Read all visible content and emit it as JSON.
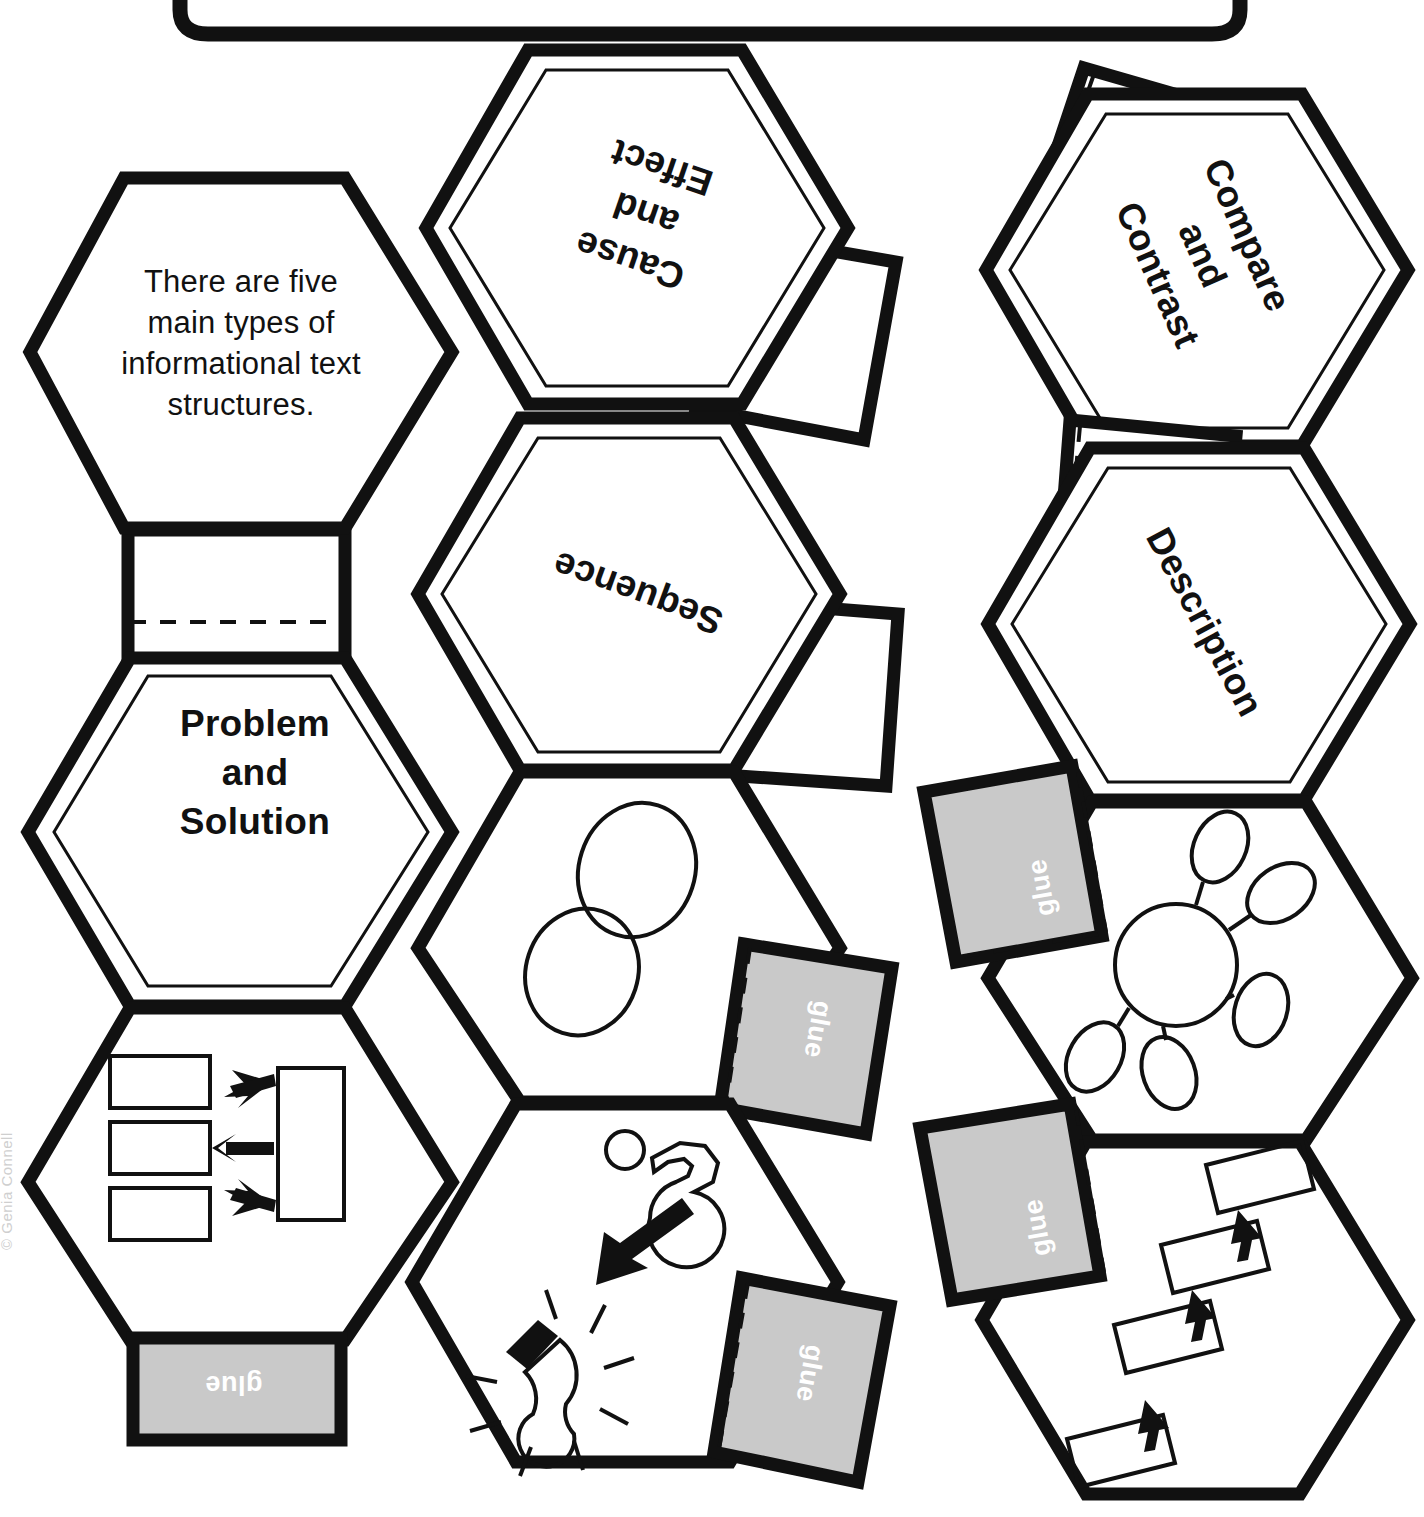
{
  "page": {
    "width": 1424,
    "height": 1517,
    "background": "#ffffff",
    "ink": "#111111",
    "glue_fill": "#c9c9c9",
    "glue_text_color": "#ffffff"
  },
  "top_bar": {
    "shape": "rounded-rectangle-bottom-edge"
  },
  "watermark": {
    "text": "© Genia Connell"
  },
  "intro": {
    "text": "There are five\nmain types of\ninformational text\nstructures."
  },
  "labels": {
    "cause_effect": "Cause\nand\nEffect",
    "compare_contrast": "Compare\nand\nContrast",
    "sequence": "Sequence",
    "description": "Description",
    "problem_solution": "Problem\nand\nSolution"
  },
  "glue_tabs": [
    {
      "id": "glue-problem-solution",
      "label": "glue"
    },
    {
      "id": "glue-venn",
      "label": "glue"
    },
    {
      "id": "glue-lightbulb",
      "label": "glue"
    },
    {
      "id": "glue-web",
      "label": "glue"
    },
    {
      "id": "glue-sequence-flow",
      "label": "glue"
    }
  ],
  "icons": {
    "venn": {
      "name": "venn-diagram-icon",
      "shapes": 2,
      "description": "two overlapping tilted ellipses"
    },
    "cause_effect": {
      "name": "question-arrow-lightbulb-icon",
      "description": "question/hook shape with arrow pointing to a lit lightbulb"
    },
    "problem_solution": {
      "name": "problem-solution-diagram-icon",
      "boxes_left": 3,
      "boxes_right": 1,
      "arrows": 3
    },
    "web": {
      "name": "web-bubble-map-icon",
      "center_nodes": 1,
      "satellite_nodes": 5
    },
    "sequence_flow": {
      "name": "sequence-flowchart-icon",
      "boxes": 4,
      "arrows": 3
    }
  },
  "hexagons": [
    {
      "id": "intro-hex",
      "name": "hexagon-intro",
      "content": "intro-text"
    },
    {
      "id": "cause-effect-hex",
      "name": "hexagon-cause-and-effect",
      "content": "label",
      "tab": "plain"
    },
    {
      "id": "compare-contrast-hex",
      "name": "hexagon-compare-and-contrast",
      "content": "label",
      "tab": "plain"
    },
    {
      "id": "problem-solution-hex",
      "name": "hexagon-problem-and-solution",
      "content": "label",
      "tab": "plain"
    },
    {
      "id": "sequence-hex",
      "name": "hexagon-sequence",
      "content": "label",
      "tab": "plain"
    },
    {
      "id": "description-hex",
      "name": "hexagon-description",
      "content": "label",
      "tab": "plain"
    },
    {
      "id": "problem-solution-icon-hex",
      "name": "hexagon-problem-solution-diagram",
      "content": "icon",
      "tab": "glue"
    },
    {
      "id": "venn-hex",
      "name": "hexagon-venn-diagram",
      "content": "icon",
      "tab": "glue"
    },
    {
      "id": "lightbulb-hex",
      "name": "hexagon-cause-effect-diagram",
      "content": "icon",
      "tab": "glue"
    },
    {
      "id": "web-hex",
      "name": "hexagon-web-diagram",
      "content": "icon",
      "tab": "glue"
    },
    {
      "id": "sequence-flow-hex",
      "name": "hexagon-sequence-flowchart",
      "content": "icon",
      "tab": "glue"
    }
  ]
}
